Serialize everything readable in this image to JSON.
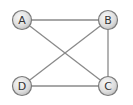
{
  "diagram": {
    "type": "undirected-graph",
    "colors": {
      "edge": "#8a8a8a",
      "node_stroke": "#7a7a7a",
      "node_fill_light": "#f4f4f4",
      "node_fill_dark": "#c8c8c8",
      "label": "#333333"
    },
    "nodes": [
      {
        "id": "A",
        "label": "A",
        "x": 22,
        "y": 20
      },
      {
        "id": "B",
        "label": "B",
        "x": 108,
        "y": 20
      },
      {
        "id": "C",
        "label": "C",
        "x": 108,
        "y": 86
      },
      {
        "id": "D",
        "label": "D",
        "x": 22,
        "y": 86
      }
    ],
    "edges": [
      {
        "from": "A",
        "to": "B"
      },
      {
        "from": "A",
        "to": "C"
      },
      {
        "from": "B",
        "to": "C"
      },
      {
        "from": "B",
        "to": "D"
      },
      {
        "from": "D",
        "to": "C"
      }
    ]
  }
}
